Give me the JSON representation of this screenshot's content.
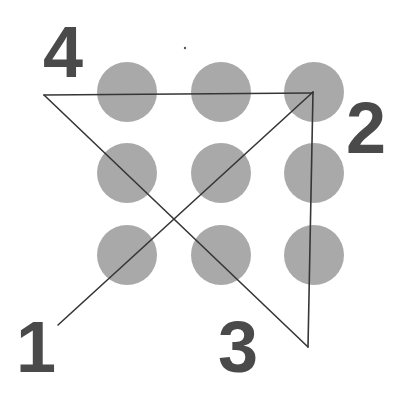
{
  "diagram": {
    "type": "nine-dots-puzzle-solution",
    "grid": {
      "rows": 3,
      "cols": 3,
      "dot_color": "#a9a9a9",
      "dot_radius": 30,
      "dots": [
        {
          "row": 1,
          "col": 1,
          "x": 127,
          "y": 92
        },
        {
          "row": 1,
          "col": 2,
          "x": 221,
          "y": 92
        },
        {
          "row": 1,
          "col": 3,
          "x": 314,
          "y": 92
        },
        {
          "row": 2,
          "col": 1,
          "x": 127,
          "y": 173
        },
        {
          "row": 2,
          "col": 2,
          "x": 221,
          "y": 173
        },
        {
          "row": 2,
          "col": 3,
          "x": 314,
          "y": 173
        },
        {
          "row": 3,
          "col": 1,
          "x": 127,
          "y": 255
        },
        {
          "row": 3,
          "col": 2,
          "x": 221,
          "y": 255
        },
        {
          "row": 3,
          "col": 3,
          "x": 314,
          "y": 255
        }
      ]
    },
    "path": {
      "line_color": "#363636",
      "segments_count": 4,
      "points": [
        {
          "label": "1",
          "x": 58,
          "y": 325
        },
        {
          "label": "2",
          "x": 313,
          "y": 92
        },
        {
          "label": "3",
          "x": 308,
          "y": 347
        },
        {
          "label": "4",
          "x": 44,
          "y": 95
        },
        {
          "label": "",
          "x": 313,
          "y": 92
        }
      ]
    },
    "labels": {
      "color": "#4a4a4a",
      "step1": "1",
      "step2": "2",
      "step3": "3",
      "step4": "4"
    }
  }
}
